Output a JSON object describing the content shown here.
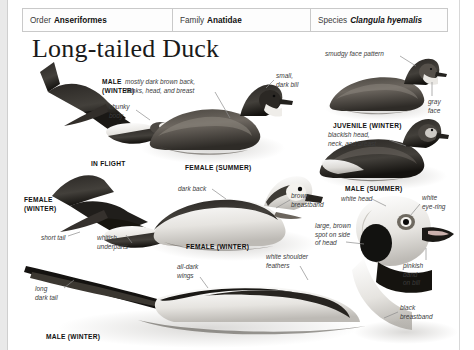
{
  "page": {
    "background_color": "#e9e9e9",
    "sheet_color": "#ffffff"
  },
  "taxonomy": {
    "order": {
      "key": "Order",
      "value": "Anseriformes"
    },
    "family": {
      "key": "Family",
      "value": "Anatidae"
    },
    "species": {
      "key": "Species",
      "value": "Clangula hyemalis"
    }
  },
  "title": "Long-tailed Duck",
  "captions": [
    {
      "id": "male-winter-flight",
      "text": "MALE\n(WINTER)"
    },
    {
      "id": "in-flight",
      "text": "IN FLIGHT"
    },
    {
      "id": "female-winter-flight",
      "text": "FEMALE\n(WINTER)"
    },
    {
      "id": "juvenile-winter",
      "text": "JUVENILE (WINTER)"
    },
    {
      "id": "male-summer",
      "text": "MALE (SUMMER)"
    },
    {
      "id": "female-summer",
      "text": "FEMALE (SUMMER)"
    },
    {
      "id": "female-winter-swim",
      "text": "FEMALE (WINTER)"
    },
    {
      "id": "male-winter-swim",
      "text": "MALE (WINTER)"
    }
  ],
  "annotations": [
    {
      "id": "chunky-body",
      "text": "chunky\nbody"
    },
    {
      "id": "mostly-dark-brown",
      "text": "mostly dark brown back,\nflanks, head, and breast"
    },
    {
      "id": "small-dark-bill",
      "text": "small,\ndark bill"
    },
    {
      "id": "smudgy-face-pattern",
      "text": "smudgy face pattern"
    },
    {
      "id": "gray-face",
      "text": "gray\nface"
    },
    {
      "id": "blackish-head",
      "text": "blackish head,\nneck, and breast"
    },
    {
      "id": "short-tail",
      "text": "short tail"
    },
    {
      "id": "whitish-underparts",
      "text": "whitish\nunderparts"
    },
    {
      "id": "dark-back",
      "text": "dark back"
    },
    {
      "id": "brown-breastband",
      "text": "brown\nbreastband"
    },
    {
      "id": "white-head",
      "text": "white head"
    },
    {
      "id": "white-eye-ring",
      "text": "white\neye-ring"
    },
    {
      "id": "large-brown-spot",
      "text": "large, brown\nspot on side\nof head"
    },
    {
      "id": "white-shoulder-feathers",
      "text": "white shoulder\nfeathers"
    },
    {
      "id": "pinkish-band-on-bill",
      "text": "pinkish\nband\non bill"
    },
    {
      "id": "black-breastband",
      "text": "black\nbreastband"
    },
    {
      "id": "all-dark-wings",
      "text": "all-dark\nwings"
    },
    {
      "id": "long-dark-tail",
      "text": "long\ndark tail"
    }
  ]
}
